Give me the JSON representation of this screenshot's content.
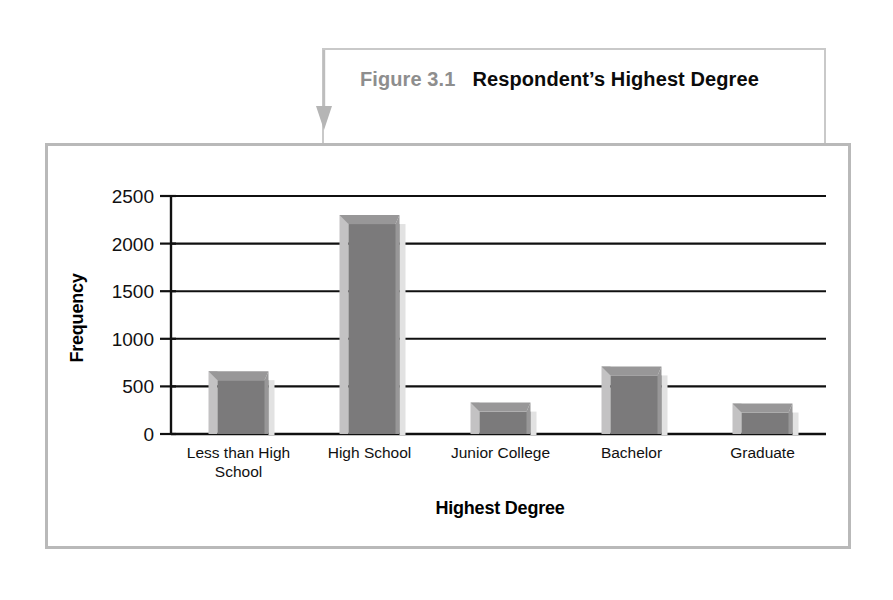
{
  "caption": {
    "figure_number": "Figure 3.1",
    "title": "Respondent’s Highest Degree",
    "arrow_icon": "arrow-down-icon"
  },
  "chart_data": {
    "type": "bar",
    "title": "",
    "xlabel": "Highest Degree",
    "ylabel": "Frequency",
    "categories": [
      "Less than High School",
      "High School",
      "Junior College",
      "Bachelor",
      "Graduate"
    ],
    "category_lines": [
      [
        "Less than High",
        "School"
      ],
      [
        "High School"
      ],
      [
        "Junior College"
      ],
      [
        "Bachelor"
      ],
      [
        "Graduate"
      ]
    ],
    "values": [
      660,
      2300,
      330,
      710,
      320
    ],
    "ylim": [
      0,
      2500
    ],
    "ytick_values": [
      0,
      500,
      1000,
      1500,
      2000,
      2500
    ],
    "ytick_labels": [
      "0",
      "500",
      "1000",
      "1500",
      "2000",
      "2500"
    ],
    "grid": true,
    "grid_axis": "y",
    "legend": "none",
    "bar_color": "#7b7a7b",
    "bar_highlight_color": "#c3c2c3",
    "bar_top_color": "#989798"
  },
  "colors": {
    "caption_number": "#8e8e8e",
    "caption_title": "#0b0b0b",
    "frame_border": "#b9b9b9",
    "callout_border": "#c9c9c9",
    "axis": "#101010",
    "background": "#ffffff"
  }
}
